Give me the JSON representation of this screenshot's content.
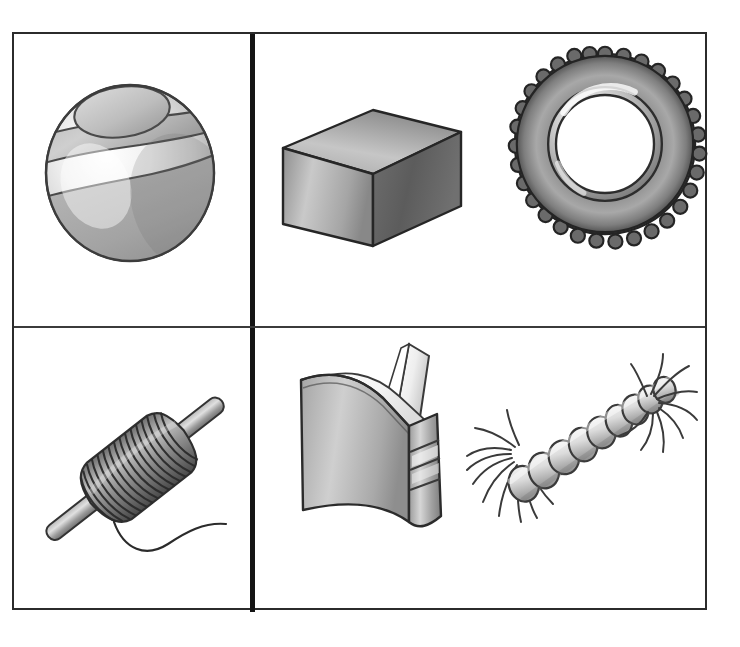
{
  "page": {
    "background_color": "#ffffff",
    "frame_color": "#2b2b2b",
    "divider_color": "#141414",
    "width": 740,
    "height": 647
  },
  "palette": {
    "outline": "#333333",
    "dark_gray": "#4a4a4a",
    "mid_gray": "#9a9a9a",
    "light_gray": "#d8d8d8",
    "highlight": "#f2f2f2",
    "shadow": "#6b6b6b",
    "white": "#ffffff"
  },
  "cells": [
    {
      "id": "top-left",
      "name": "Top left cell",
      "objects": [
        "ball"
      ]
    },
    {
      "id": "top-right",
      "name": "Top right cell",
      "objects": [
        "cube",
        "tire"
      ]
    },
    {
      "id": "bottom-left",
      "name": "Bottom left cell",
      "objects": [
        "spool"
      ]
    },
    {
      "id": "bottom-right",
      "name": "Bottom right cell",
      "objects": [
        "book",
        "rope"
      ]
    }
  ],
  "objects": {
    "ball": {
      "label": "Ball",
      "alt": "Striped sphere with an elliptical cap on top and two banded stripes",
      "shape": "sphere",
      "features": [
        "top cap ellipse",
        "upper stripe band",
        "lower stripe band",
        "glossy highlight"
      ]
    },
    "cube": {
      "label": "Cube",
      "alt": "Shaded box seen in three-quarter view showing top, front and right faces",
      "shape": "box",
      "features": [
        "top face",
        "front face",
        "right face"
      ]
    },
    "tire": {
      "label": "Tire",
      "alt": "Tractor tire seen face on with knobby tread blocks and a white hub opening",
      "shape": "torus",
      "tread_count": 30,
      "features": [
        "tread blocks",
        "sidewall gradient",
        "inner rim ring",
        "hub hole"
      ]
    },
    "spool": {
      "label": "Spool of thread",
      "alt": "Thread wound in many coils around a tapered rod with a loose strand trailing off",
      "shape": "wound-coil",
      "coil_count": 26,
      "features": [
        "rod",
        "wound coils",
        "loose thread"
      ]
    },
    "book": {
      "label": "Book",
      "alt": "Hardcover book standing upright, partly open, with a page lifting and banded spine",
      "shape": "book",
      "features": [
        "front cover",
        "spine with two bands",
        "lifting page",
        "page block"
      ]
    },
    "rope": {
      "label": "Rope",
      "alt": "Short twisted rope running diagonally with frayed tassel ends at both tips",
      "shape": "twisted-cord",
      "twist_count": 9,
      "features": [
        "twisted strands",
        "frayed lower-left end",
        "frayed upper-right end"
      ]
    }
  }
}
